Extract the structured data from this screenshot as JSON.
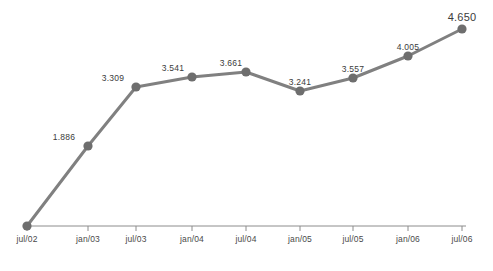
{
  "chart_data": {
    "type": "line",
    "title": "",
    "subtitle": "",
    "xlabel": "",
    "ylabel": "",
    "categories": [
      "jul/02",
      "jan/03",
      "jul/03",
      "jan/04",
      "jul/04",
      "jan/05",
      "jul/05",
      "jan/06",
      "jul/06"
    ],
    "values": [
      0,
      1.886,
      3.309,
      3.541,
      3.661,
      3.241,
      3.557,
      4.005,
      4.65
    ],
    "point_labels": [
      "",
      "1.886",
      "3.309",
      "3.541",
      "3.661",
      "3.241",
      "3.557",
      "4.005",
      "4.650"
    ],
    "series": [
      {
        "name": "",
        "values": [
          0,
          1.886,
          3.309,
          3.541,
          3.661,
          3.241,
          3.557,
          4.005,
          4.65
        ]
      }
    ],
    "ylim": [
      0,
      4.9
    ],
    "grid": false,
    "legend": "none",
    "axis": {
      "x_axis_visible": true,
      "y_axis_visible": false,
      "tick_marks": "below-axis"
    },
    "emphasis": {
      "largest_label_index": 8
    },
    "colors": {
      "line": "#808080",
      "marker": "#6e6e6e",
      "axis": "#8c8c8c",
      "data_label_text": "#3b3b3b",
      "axis_label_text": "#4a4a4a",
      "background": "#ffffff"
    },
    "geometry": {
      "points": [
        {
          "x": 27,
          "y": 226
        },
        {
          "x": 88,
          "y": 146
        },
        {
          "x": 136,
          "y": 87
        },
        {
          "x": 192,
          "y": 77
        },
        {
          "x": 246,
          "y": 72
        },
        {
          "x": 300,
          "y": 91
        },
        {
          "x": 353,
          "y": 78
        },
        {
          "x": 408,
          "y": 56
        },
        {
          "x": 462,
          "y": 29
        }
      ],
      "label_positions": [
        {
          "x": 27,
          "y": 214
        },
        {
          "x": 64,
          "y": 141
        },
        {
          "x": 113,
          "y": 82
        },
        {
          "x": 173,
          "y": 72
        },
        {
          "x": 231,
          "y": 67
        },
        {
          "x": 300,
          "y": 86
        },
        {
          "x": 353,
          "y": 73
        },
        {
          "x": 408,
          "y": 51
        },
        {
          "x": 462,
          "y": 23
        }
      ],
      "axis_y": 226,
      "axis_x_start": 27,
      "axis_x_end": 466,
      "tick_length": 5,
      "axis_label_y": 235,
      "marker_radius": 4.6,
      "line_width": 3
    }
  }
}
